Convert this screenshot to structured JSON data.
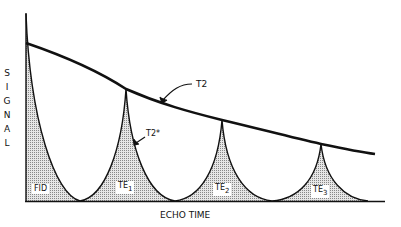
{
  "diagram": {
    "y_axis_letters": [
      "S",
      "I",
      "G",
      "N",
      "A",
      "L"
    ],
    "x_axis_label": "ECHO TIME",
    "annotations": {
      "t2": "T2",
      "t2_star": "T2*"
    },
    "echo_labels": [
      {
        "main": "FID",
        "sub": ""
      },
      {
        "main": "TE",
        "sub": "1"
      },
      {
        "main": "TE",
        "sub": "2"
      },
      {
        "main": "TE",
        "sub": "3"
      }
    ]
  }
}
